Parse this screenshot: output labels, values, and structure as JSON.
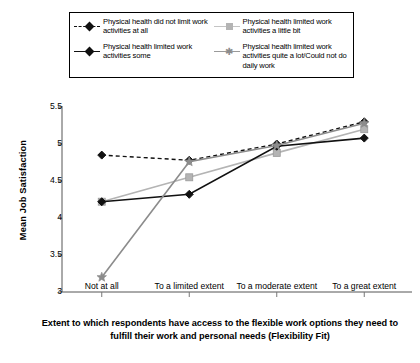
{
  "legend": {
    "items": [
      {
        "label": "Physical health did not limit work activities at all",
        "key": "black-dashed-diamond",
        "color": "#111111",
        "dash": "dashed",
        "marker": "diamond"
      },
      {
        "label": "Physical health limited work activities a little bit",
        "key": "gray-solid-square",
        "color": "#b4b4b4",
        "dash": "solid",
        "marker": "square"
      },
      {
        "label": "Physical health limited work activities some",
        "key": "black-solid-diamond",
        "color": "#111111",
        "dash": "solid",
        "marker": "diamond"
      },
      {
        "label": "Physical health limited work activities quite a lot/Could not do daily work",
        "key": "gray-solid-star",
        "color": "#8c8c8c",
        "dash": "solid",
        "marker": "star"
      }
    ]
  },
  "chart_data": {
    "type": "line",
    "title": "",
    "xlabel": "Extent to which respondents have access to the flexible work options they need to fulfill their work and personal needs (Flexibility Fit)",
    "ylabel": "Mean Job Satisfaction",
    "categories": [
      "Not at all",
      "To a limited extent",
      "To a moderate extent",
      "To a great extent"
    ],
    "ylim": [
      3,
      5.5
    ],
    "yticks": [
      3,
      3.5,
      4,
      4.5,
      5,
      5.5
    ],
    "ytick_labels": [
      "3",
      "3.5",
      "4",
      "4.5",
      "5",
      "5.5"
    ],
    "grid": false,
    "legend_position": "top",
    "series": [
      {
        "name": "Physical health did not limit work activities at all",
        "values": [
          4.85,
          4.78,
          5.0,
          5.3
        ],
        "color": "#111111",
        "dash": "dashed",
        "marker": "diamond"
      },
      {
        "name": "Physical health limited work activities a little bit",
        "values": [
          4.22,
          4.55,
          4.88,
          5.2
        ],
        "color": "#b4b4b4",
        "dash": "solid",
        "marker": "square"
      },
      {
        "name": "Physical health limited work activities some",
        "values": [
          4.22,
          4.32,
          4.97,
          5.08
        ],
        "color": "#111111",
        "dash": "solid",
        "marker": "diamond"
      },
      {
        "name": "Physical health limited work activities quite a lot/Could not do daily work",
        "values": [
          3.2,
          4.76,
          4.98,
          5.28
        ],
        "color": "#8c8c8c",
        "dash": "solid",
        "marker": "star"
      }
    ]
  }
}
